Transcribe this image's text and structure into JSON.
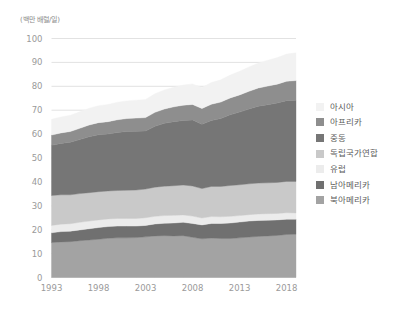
{
  "chart_data": {
    "type": "area",
    "title": "",
    "subtitle": "",
    "unit_label": "(백만 배럴/일)",
    "xlabel": "",
    "ylabel": "",
    "stacked": true,
    "grid": true,
    "legend_position": "right",
    "xlim": [
      1993,
      2019
    ],
    "ylim": [
      0,
      100
    ],
    "ytick_labels": [
      "0",
      "10",
      "20",
      "30",
      "40",
      "50",
      "60",
      "70",
      "80",
      "90",
      "100"
    ],
    "ytick_values": [
      0,
      10,
      20,
      30,
      40,
      50,
      60,
      70,
      80,
      90,
      100
    ],
    "xtick_labels": [
      "1993",
      "1998",
      "2003",
      "2008",
      "2013",
      "2018"
    ],
    "xtick_values": [
      1993,
      1998,
      2003,
      2008,
      2013,
      2018
    ],
    "x": [
      1993,
      1994,
      1995,
      1996,
      1997,
      1998,
      1999,
      2000,
      2001,
      2002,
      2003,
      2004,
      2005,
      2006,
      2007,
      2008,
      2009,
      2010,
      2011,
      2012,
      2013,
      2014,
      2015,
      2016,
      2017,
      2018,
      2019
    ],
    "series": [
      {
        "name": "북아메리카",
        "color": "#a3a3a3",
        "values": [
          14.6,
          14.9,
          15.0,
          15.4,
          15.7,
          16.0,
          16.4,
          16.6,
          16.6,
          16.7,
          17.0,
          17.4,
          17.5,
          17.4,
          17.5,
          16.8,
          16.2,
          16.5,
          16.3,
          16.3,
          16.6,
          16.9,
          17.2,
          17.4,
          17.6,
          18.0,
          18.1
        ]
      },
      {
        "name": "남아메리카",
        "color": "#707070",
        "values": [
          4.1,
          4.3,
          4.4,
          4.5,
          4.7,
          4.9,
          4.9,
          4.9,
          4.9,
          4.8,
          4.8,
          5.0,
          5.2,
          5.4,
          5.6,
          5.8,
          5.8,
          6.1,
          6.3,
          6.5,
          6.6,
          6.7,
          6.7,
          6.6,
          6.5,
          6.4,
          6.3
        ]
      },
      {
        "name": "유럽",
        "color": "#ececec",
        "values": [
          3.1,
          3.1,
          3.1,
          3.2,
          3.2,
          3.2,
          3.2,
          3.2,
          3.2,
          3.2,
          3.2,
          3.2,
          3.2,
          3.2,
          3.1,
          3.1,
          2.9,
          2.9,
          2.8,
          2.8,
          2.7,
          2.7,
          2.7,
          2.7,
          2.7,
          2.7,
          2.6
        ]
      },
      {
        "name": "독립국가연합",
        "color": "#c9c9c9",
        "values": [
          12.5,
          12.3,
          12.1,
          12.0,
          11.9,
          11.8,
          11.7,
          11.7,
          11.8,
          11.9,
          12.0,
          12.2,
          12.3,
          12.4,
          12.5,
          12.6,
          12.3,
          12.6,
          12.7,
          12.9,
          12.9,
          12.9,
          12.9,
          12.9,
          13.0,
          13.1,
          13.2
        ]
      },
      {
        "name": "중동",
        "color": "#767676",
        "values": [
          21.0,
          21.5,
          22.0,
          22.6,
          23.4,
          23.8,
          23.8,
          24.3,
          24.6,
          24.6,
          24.3,
          25.5,
          26.3,
          26.8,
          27.0,
          27.6,
          26.9,
          27.6,
          28.4,
          29.6,
          30.4,
          31.3,
          32.2,
          32.7,
          33.2,
          33.8,
          34.0
        ]
      },
      {
        "name": "아프리카",
        "color": "#8e8e8e",
        "values": [
          4.3,
          4.4,
          4.5,
          4.7,
          4.9,
          5.1,
          5.2,
          5.3,
          5.4,
          5.5,
          5.6,
          5.8,
          6.0,
          6.2,
          6.4,
          6.5,
          6.6,
          6.8,
          6.9,
          7.0,
          7.2,
          7.4,
          7.6,
          7.8,
          7.9,
          8.1,
          8.2
        ]
      },
      {
        "name": "아시아",
        "color": "#f2f2f2",
        "values": [
          6.6,
          6.7,
          6.8,
          6.9,
          7.0,
          7.1,
          7.2,
          7.3,
          7.4,
          7.5,
          7.6,
          7.8,
          8.0,
          8.2,
          8.4,
          8.6,
          8.8,
          9.1,
          9.3,
          9.6,
          9.9,
          10.2,
          10.5,
          10.8,
          11.1,
          11.4,
          11.6
        ]
      }
    ]
  },
  "legend": {
    "items": [
      {
        "label": "아시아",
        "color": "#f2f2f2"
      },
      {
        "label": "아프리카",
        "color": "#8e8e8e"
      },
      {
        "label": "중동",
        "color": "#767676"
      },
      {
        "label": "독립국가연합",
        "color": "#c9c9c9"
      },
      {
        "label": "유럽",
        "color": "#ececec"
      },
      {
        "label": "남아메리카",
        "color": "#707070"
      },
      {
        "label": "북아메리카",
        "color": "#a3a3a3"
      }
    ]
  },
  "axes": {
    "gridline_color": "#e2e2e2",
    "tick_text_color": "#9a9a9a"
  }
}
